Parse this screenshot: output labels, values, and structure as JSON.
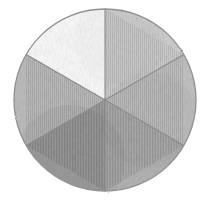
{
  "figure": {
    "medium": "graphite pencil on white paper",
    "background_color": "#ffffff",
    "outline_color": "#8f8f8f",
    "divider_color": "#8a8a8a",
    "canvas": {
      "width": 211,
      "height": 206
    },
    "circle": {
      "cx": 105,
      "cy": 100,
      "r": 91
    }
  },
  "chart_data": {
    "type": "pie",
    "title": "",
    "subtitle": "",
    "xlabel": "",
    "ylabel": "",
    "grid": false,
    "legend": "none",
    "labels_shown": false,
    "total_slices": 6,
    "categories": [
      "Sector 1",
      "Sector 2",
      "Sector 3",
      "Sector 4",
      "Sector 5",
      "Sector 6"
    ],
    "values": [
      16.67,
      16.67,
      16.67,
      16.67,
      16.67,
      16.67
    ],
    "value_unit": "percent",
    "slices": [
      {
        "name": "top-left-sector",
        "start_angle_deg": 210,
        "end_angle_deg": 270,
        "value": 16.67,
        "shade_name": "near-white",
        "fill": "#fafafa",
        "tone_level": 1
      },
      {
        "name": "top-right-sector",
        "start_angle_deg": 270,
        "end_angle_deg": 330,
        "value": 16.67,
        "shade_name": "light-gray",
        "fill": "#cfcfcf",
        "tone_level": 3
      },
      {
        "name": "right-sector",
        "start_angle_deg": 330,
        "end_angle_deg": 30,
        "value": 16.67,
        "shade_name": "medium-gray",
        "fill": "#c2c2c2",
        "tone_level": 4
      },
      {
        "name": "bottom-right-sector",
        "start_angle_deg": 30,
        "end_angle_deg": 90,
        "value": 16.67,
        "shade_name": "medium-dark-gray",
        "fill": "#b4b4b4",
        "tone_level": 5
      },
      {
        "name": "bottom-left-sector",
        "start_angle_deg": 90,
        "end_angle_deg": 150,
        "value": 16.67,
        "shade_name": "darkest-gray",
        "fill": "#a3a3a3",
        "tone_level": 6
      },
      {
        "name": "left-sector",
        "start_angle_deg": 150,
        "end_angle_deg": 210,
        "value": 16.67,
        "shade_name": "medium-gray",
        "fill": "#bdbdbd",
        "tone_level": 4
      }
    ],
    "dividers": [
      {
        "name": "vertical-divider",
        "angle_deg": 90
      },
      {
        "name": "diagonal-divider-ne-sw",
        "angle_deg": 30
      },
      {
        "name": "diagonal-divider-nw-se",
        "angle_deg": 150
      }
    ]
  }
}
